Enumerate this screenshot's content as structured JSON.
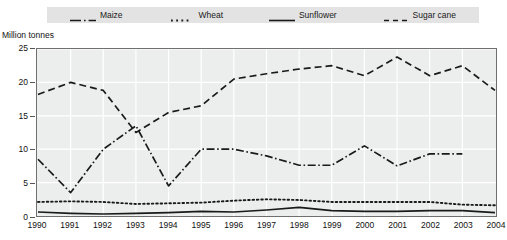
{
  "legend": {
    "position": "top",
    "items": [
      {
        "label": "Maize",
        "style": "dash-dot",
        "icon": "line-dashdot-icon"
      },
      {
        "label": "Wheat",
        "style": "dotted",
        "icon": "line-dotted-icon"
      },
      {
        "label": "Sunflower",
        "style": "solid",
        "icon": "line-solid-icon"
      },
      {
        "label": "Sugar cane",
        "style": "dashed",
        "icon": "line-dashed-icon"
      }
    ]
  },
  "axes": {
    "y_caption": "Million tonnes",
    "y_ticks": [
      "0",
      "5",
      "10",
      "15",
      "20",
      "25"
    ],
    "x_ticks": [
      "1990",
      "1991",
      "1992",
      "1993",
      "1994",
      "1995",
      "1996",
      "1997",
      "1998",
      "1999",
      "2000",
      "2001",
      "2002",
      "2003",
      "2004"
    ]
  },
  "colors": {
    "line": "#1a1a1a",
    "plot_background": "#eceded",
    "gridline": "#ffffff",
    "axis": "#6f6f6f",
    "legend_background": "#e3e3e3"
  },
  "chart_data": {
    "type": "line",
    "title": "",
    "xlabel": "",
    "ylabel": "Million tonnes",
    "ylim": [
      0,
      25
    ],
    "yticks": [
      0,
      5,
      10,
      15,
      20,
      25
    ],
    "grid": true,
    "legend_position": "top",
    "x": [
      1990,
      1991,
      1992,
      1993,
      1994,
      1995,
      1996,
      1997,
      1998,
      1999,
      2000,
      2001,
      2002,
      2003,
      2004
    ],
    "series": [
      {
        "name": "Maize",
        "style": "dash-dot",
        "values": [
          8.5,
          3.5,
          10.0,
          13.5,
          4.5,
          10.0,
          10.0,
          9.0,
          7.6,
          7.6,
          10.5,
          7.5,
          9.3,
          9.3,
          null
        ]
      },
      {
        "name": "Wheat",
        "style": "dotted",
        "values": [
          2.1,
          2.2,
          2.1,
          1.8,
          1.9,
          2.0,
          2.3,
          2.5,
          2.4,
          2.1,
          2.1,
          2.1,
          2.1,
          1.7,
          1.6
        ]
      },
      {
        "name": "Sunflower",
        "style": "solid",
        "values": [
          0.6,
          0.4,
          0.3,
          0.4,
          0.5,
          0.7,
          0.6,
          0.9,
          1.3,
          0.8,
          0.7,
          0.7,
          0.8,
          0.8,
          0.5
        ]
      },
      {
        "name": "Sugar cane",
        "style": "dashed",
        "values": [
          18.2,
          20.0,
          18.8,
          12.5,
          15.5,
          16.5,
          20.5,
          21.3,
          22.0,
          22.5,
          21.0,
          23.8,
          21.0,
          22.5,
          18.8
        ]
      }
    ]
  }
}
